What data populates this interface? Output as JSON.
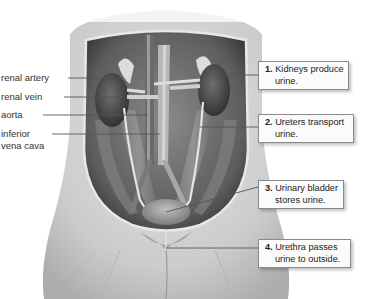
{
  "figure": {
    "left_labels": [
      {
        "id": "renal-artery",
        "text": "renal artery"
      },
      {
        "id": "renal-vein",
        "text": "renal vein"
      },
      {
        "id": "aorta",
        "text": "aorta"
      },
      {
        "id": "inferior-vena-cava",
        "line1": "inferior",
        "line2": "vena cava"
      }
    ],
    "callouts": [
      {
        "number": "1.",
        "line1": "Kidneys produce",
        "line2": "urine."
      },
      {
        "number": "2.",
        "line1": "Ureters transport",
        "line2": "urine."
      },
      {
        "number": "3.",
        "line1": "Urinary bladder",
        "line2": "stores urine."
      },
      {
        "number": "4.",
        "line1": "Urethra passes",
        "line2": "urine to outside."
      }
    ]
  }
}
